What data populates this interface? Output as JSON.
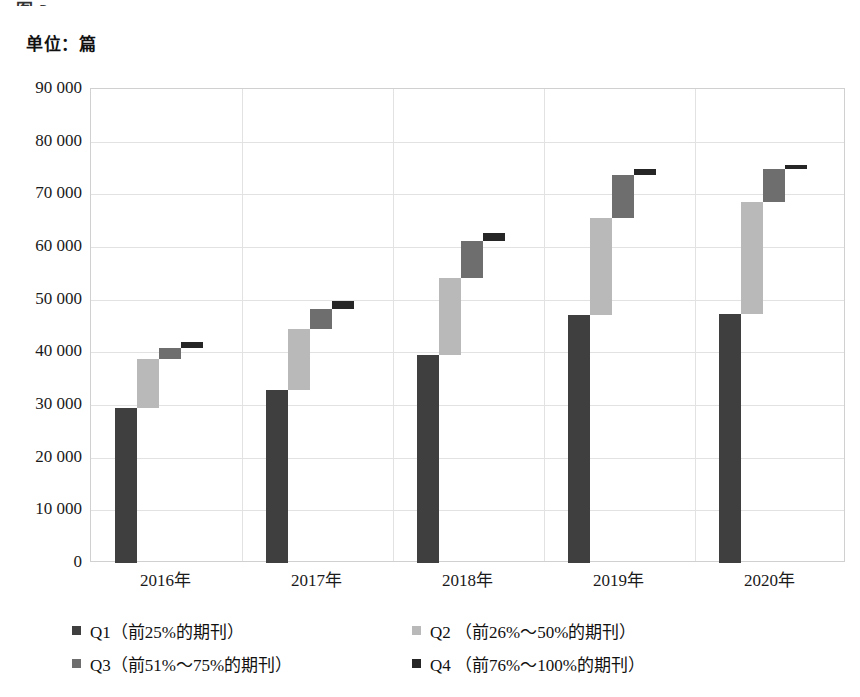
{
  "top_cropped_text": "图 3",
  "unit_label": "单位：篇",
  "chart_data": {
    "type": "bar",
    "subtype": "waterfall-stacked",
    "title": "",
    "subtitle": "单位：篇",
    "xlabel": "",
    "ylabel": "",
    "unit": "篇",
    "grid": true,
    "legend_position": "bottom",
    "ylim": [
      0,
      90000
    ],
    "yticks": [
      0,
      10000,
      20000,
      30000,
      40000,
      50000,
      60000,
      70000,
      80000,
      90000
    ],
    "ytick_labels": [
      "0",
      "10 000",
      "20 000",
      "30 000",
      "40 000",
      "50 000",
      "60 000",
      "70 000",
      "80 000",
      "90 000"
    ],
    "categories": [
      "2016年",
      "2017年",
      "2018年",
      "2019年",
      "2020年"
    ],
    "series": [
      {
        "name": "Q1",
        "legend_label": "Q1（前25%的期刊）",
        "color": "#3f3f3f",
        "values": [
          29500,
          32900,
          39500,
          47100,
          47200
        ],
        "cumulative_top": [
          29500,
          32900,
          39500,
          47100,
          47200
        ]
      },
      {
        "name": "Q2",
        "legend_label": "Q2 （前26%～50%的期刊）",
        "color": "#b9b9b9",
        "values": [
          9200,
          11600,
          14700,
          18400,
          21300
        ],
        "cumulative_top": [
          38700,
          44500,
          54200,
          65500,
          68500
        ]
      },
      {
        "name": "Q3",
        "legend_label": "Q3（前51%～75%的期刊）",
        "color": "#6e6e6e",
        "values": [
          2100,
          3800,
          7000,
          8100,
          6300
        ],
        "cumulative_top": [
          40800,
          48300,
          61200,
          73600,
          74800
        ]
      },
      {
        "name": "Q4",
        "legend_label": "Q4 （前76%～100%的期刊）",
        "color": "#262626",
        "values": [
          1100,
          1400,
          1500,
          1200,
          700
        ],
        "cumulative_top": [
          41900,
          49700,
          62700,
          74800,
          75500
        ]
      }
    ]
  },
  "legend": {
    "items": [
      {
        "label": "Q1（前25%的期刊）",
        "color": "#3f3f3f"
      },
      {
        "label": "Q2 （前26%～50%的期刊）",
        "color": "#b9b9b9"
      },
      {
        "label": "Q3（前51%～75%的期刊）",
        "color": "#6e6e6e"
      },
      {
        "label": "Q4 （前76%～100%的期刊）",
        "color": "#262626"
      }
    ]
  }
}
